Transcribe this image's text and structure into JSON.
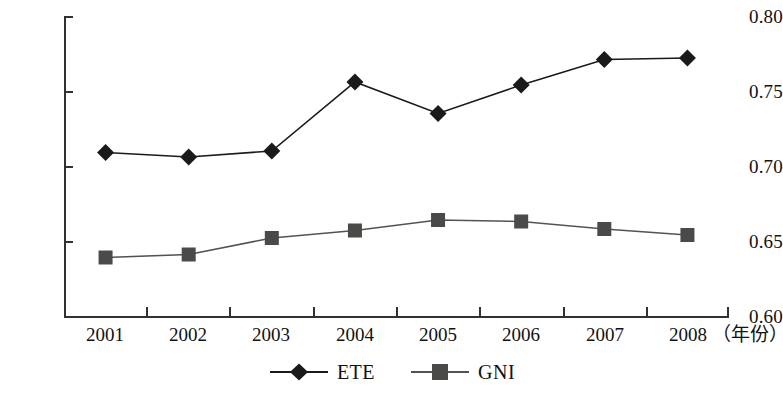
{
  "chart_data": {
    "type": "line",
    "title": "",
    "subtitle": "",
    "xlabel": "(年份)",
    "ylabel": "",
    "categories": [
      "2001",
      "2002",
      "2003",
      "2004",
      "2005",
      "2006",
      "2007",
      "2008"
    ],
    "series": [
      {
        "name": "ETE",
        "marker": "diamond",
        "color": "#1a1a1a",
        "values": [
          0.709,
          0.706,
          0.71,
          0.756,
          0.735,
          0.754,
          0.771,
          0.772
        ]
      },
      {
        "name": "GNI",
        "marker": "square",
        "color": "#4a4a48",
        "values": [
          0.639,
          0.641,
          0.652,
          0.657,
          0.664,
          0.663,
          0.658,
          0.654
        ]
      }
    ],
    "ylim": [
      0.6,
      0.8
    ],
    "yticks": [
      "0.60",
      "0.65",
      "0.70",
      "0.75",
      "0.80"
    ],
    "ytick_values": [
      0.6,
      0.65,
      0.7,
      0.75,
      0.8
    ],
    "grid": false,
    "legend_position": "bottom"
  },
  "axis": {
    "y_labels": [
      "0.80",
      "0.75",
      "0.70",
      "0.65",
      "0.60"
    ],
    "x_labels": [
      "2001",
      "2002",
      "2003",
      "2004",
      "2005",
      "2006",
      "2007",
      "2008"
    ],
    "x_unit": "（年份）"
  },
  "legend": {
    "items": [
      {
        "label": "ETE",
        "marker": "diamond-marker",
        "color": "#1a1a1a"
      },
      {
        "label": "GNI",
        "marker": "square-marker",
        "color": "#4a4a48"
      }
    ]
  }
}
